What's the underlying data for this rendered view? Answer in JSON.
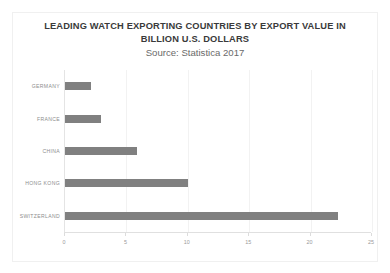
{
  "chart_data": {
    "type": "bar",
    "orientation": "horizontal",
    "title": "LEADING WATCH EXPORTING COUNTRIES BY EXPORT VALUE IN BILLION U.S. DOLLARS",
    "subtitle": "Source: Statistica 2017",
    "xlabel": "",
    "ylabel": "",
    "categories": [
      "GERMANY",
      "FRANCE",
      "CHINA",
      "HONG KONG",
      "SWITZERLAND"
    ],
    "values": [
      2.1,
      2.9,
      5.9,
      10.0,
      22.2
    ],
    "xlim": [
      0,
      25
    ],
    "xticks": [
      0,
      5,
      10,
      15,
      20,
      25
    ],
    "xtick_labels": [
      "0",
      "5",
      "10",
      "15",
      "20",
      "25"
    ],
    "grid": true,
    "legend": false,
    "bar_color": "#808080",
    "background_color": "#ffffff"
  }
}
